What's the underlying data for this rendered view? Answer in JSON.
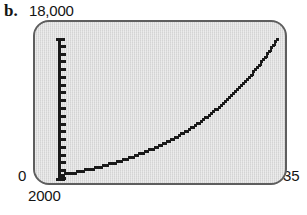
{
  "figure": {
    "part_label": "b."
  },
  "chart_data": {
    "type": "line",
    "title": "",
    "subtitle": "",
    "xlabel": "",
    "ylabel": "",
    "grid": false,
    "legend": null,
    "style": "graphing-calculator-screen",
    "axis_labels": {
      "y_max": "18,000",
      "y_min": "0",
      "x_min": "2000",
      "x_max": "35"
    },
    "xlim": [
      0,
      35
    ],
    "ylim": [
      0,
      18000
    ],
    "x_tick_dots": 7,
    "x_tick_values": [
      5,
      10,
      15,
      20,
      25,
      30,
      35
    ],
    "y_tick_count": 18,
    "y_tick_step": 1000,
    "x": [
      0,
      1,
      2,
      3,
      4,
      5,
      6,
      7,
      8,
      9,
      10,
      11,
      12,
      13,
      14,
      15,
      16,
      17,
      18,
      19,
      20,
      21,
      22,
      23,
      24,
      25,
      26,
      27,
      28,
      29,
      30,
      31,
      32,
      33,
      34,
      35
    ],
    "values": [
      2000,
      2130,
      2268,
      2415,
      2571,
      2738,
      2915,
      3104,
      3305,
      3519,
      3747,
      3990,
      4249,
      4525,
      4818,
      5131,
      5464,
      5818,
      6196,
      6598,
      7026,
      7482,
      7967,
      8484,
      9035,
      9621,
      10245,
      10910,
      11618,
      12372,
      13175,
      14030,
      14940,
      15910,
      16942,
      18000
    ],
    "annotations": []
  }
}
